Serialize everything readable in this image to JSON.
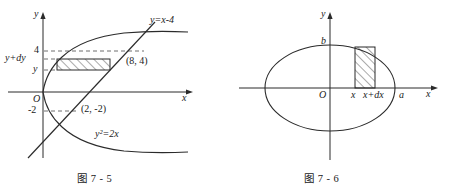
{
  "figure_left": {
    "caption": "图 7 - 5",
    "axis_y_label": "y",
    "axis_x_label": "x",
    "origin_label": "O",
    "ticks_y": [
      "4",
      "y+dy",
      "y",
      "-2"
    ],
    "curve_labels": {
      "line": "y=x-4",
      "parabola": "y²=2x"
    },
    "points": [
      "(8, 4)",
      "(2, -2)"
    ],
    "shaded_element": "horizontal-hatched-strip"
  },
  "figure_right": {
    "caption": "图 7 - 6",
    "axis_y_label": "y",
    "axis_x_label": "x",
    "origin_label": "O",
    "tick_b": "b",
    "tick_a": "a",
    "tick_x": "x",
    "tick_xdx": "x+dx",
    "shape": "ellipse",
    "shaded_element": "vertical-hatched-strip"
  },
  "colors": {
    "ink": "#1a1a1a",
    "curve": "#2b2b2b",
    "background": "#ffffff"
  }
}
